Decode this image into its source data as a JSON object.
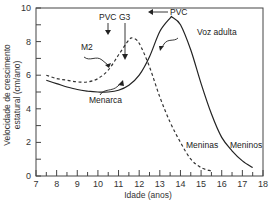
{
  "chart_data": {
    "type": "line",
    "title": "",
    "xlabel": "Idade (anos)",
    "ylabel_line1": "Velocidade de crescimento",
    "ylabel_line2": "estatural (cm/ano)",
    "ylabel": "Velocidade de crescimento estatural (cm/ano)",
    "xlim": [
      7,
      18
    ],
    "ylim": [
      0,
      10
    ],
    "x_ticks": [
      "7",
      "8",
      "9",
      "10",
      "11",
      "12",
      "13",
      "14",
      "15",
      "16",
      "17",
      "18"
    ],
    "y_ticks": [
      "0",
      "2",
      "4",
      "6",
      "8",
      "10"
    ],
    "grid": false,
    "series": [
      {
        "name": "Meninas",
        "style": "dashed",
        "x": [
          7.5,
          8.0,
          8.5,
          9.0,
          9.5,
          10.0,
          10.5,
          11.0,
          11.5,
          11.7,
          12.0,
          12.5,
          13.0,
          13.5,
          14.0,
          14.5,
          15.0,
          15.5
        ],
        "y": [
          6.0,
          5.8,
          5.7,
          5.6,
          5.6,
          5.8,
          6.3,
          7.2,
          8.1,
          8.2,
          7.9,
          6.5,
          4.7,
          3.2,
          2.0,
          1.0,
          0.5,
          0.3
        ]
      },
      {
        "name": "Meninos",
        "style": "solid",
        "x": [
          7.5,
          8.0,
          8.5,
          9.0,
          9.5,
          10.0,
          10.5,
          11.0,
          11.5,
          12.0,
          12.5,
          13.0,
          13.5,
          13.6,
          14.0,
          14.5,
          15.0,
          15.5,
          16.0,
          16.5,
          17.0,
          17.5
        ],
        "y": [
          5.7,
          5.5,
          5.3,
          5.15,
          5.05,
          5.0,
          5.0,
          5.1,
          5.4,
          6.0,
          7.1,
          8.6,
          9.4,
          9.45,
          9.0,
          7.5,
          5.5,
          3.7,
          2.3,
          1.5,
          0.9,
          0.5
        ]
      }
    ],
    "annotations": [
      {
        "text": "PVC",
        "x": 11.7,
        "y": 8.2,
        "series": "Meninas"
      },
      {
        "text": "G3",
        "x": 12.4,
        "y": 6.3,
        "series": "Meninos"
      },
      {
        "text": "PVC",
        "x": 13.6,
        "y": 9.45,
        "series": "Meninos"
      },
      {
        "text": "M2",
        "x": 11.2,
        "y": 7.3,
        "series": "Meninas"
      },
      {
        "text": "Menarca",
        "x": 12.7,
        "y": 5.5,
        "series": "Meninas"
      },
      {
        "text": "Voz adulta",
        "x": 14.4,
        "y": 7.8,
        "series": "Meninos"
      },
      {
        "text": "Meninas",
        "x": 15.1,
        "y": 2.0
      },
      {
        "text": "Meninos",
        "x": 17.0,
        "y": 2.0
      }
    ]
  },
  "labels": {
    "pvc_girls": "PVC",
    "g3": "G3",
    "pvc_boys": "PVC",
    "m2": "M2",
    "menarca": "Menarca",
    "voz_adulta": "Voz adulta",
    "meninas": "Meninas",
    "meninos": "Meninos"
  }
}
